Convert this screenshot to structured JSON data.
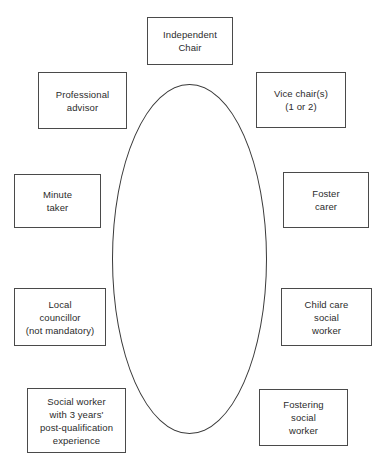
{
  "diagram": {
    "type": "fostering-panel-membership",
    "center": {
      "shape": "ellipse",
      "label": ""
    },
    "colors": {
      "background": "#ffffff",
      "box_border": "#4a4a4a",
      "ellipse_border": "#3a3a3a",
      "text": "#2b2b2b"
    },
    "nodes": [
      {
        "id": "independent-chair",
        "label": "Independent\nChair",
        "position": "top"
      },
      {
        "id": "professional-advisor",
        "label": "Professional\nadvisor",
        "position": "upper-left"
      },
      {
        "id": "vice-chairs",
        "label": "Vice chair(s)\n(1 or 2)",
        "position": "upper-right"
      },
      {
        "id": "minute-taker",
        "label": "Minute\ntaker",
        "position": "mid-left"
      },
      {
        "id": "foster-carer",
        "label": "Foster\ncarer",
        "position": "mid-right"
      },
      {
        "id": "local-councillor",
        "label": "Local\ncouncillor\n(not mandatory)",
        "position": "lower-left"
      },
      {
        "id": "childcare-social-worker",
        "label": "Child care\nsocial\nworker",
        "position": "lower-right"
      },
      {
        "id": "experienced-social-worker",
        "label": "Social worker\nwith 3 years'\npost-qualification\nexperience",
        "position": "bottom-left"
      },
      {
        "id": "fostering-social-worker",
        "label": "Fostering\nsocial\nworker",
        "position": "bottom-right"
      }
    ]
  }
}
